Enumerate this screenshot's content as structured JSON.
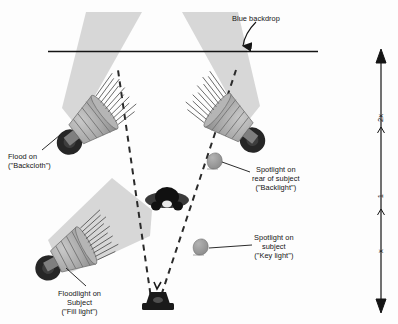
{
  "diagram": {
    "background_color": "#fdfdfd",
    "line_color": "#141414",
    "beam_color": "#d2d2d2",
    "fixture_body_color": "#a8a8a8",
    "fixture_base_color": "#2b2b2b",
    "spot_color": "#9a9a9a"
  },
  "labels": {
    "backdrop": {
      "text": "Blue backdrop",
      "x": 232,
      "y": 14
    },
    "flood_backcloth": {
      "line1": "Flood on",
      "line2": "(\"Backcloth\")",
      "x": 8,
      "y": 152
    },
    "spot_backlight": {
      "line1": "Spotlight on",
      "line2": "rear of subject",
      "line3": "(\"Backlight\")",
      "x": 252,
      "y": 165
    },
    "spot_key": {
      "line1": "Spotlight on",
      "line2": "subject",
      "line3": "(\"Key light\")",
      "x": 254,
      "y": 233
    },
    "flood_fill": {
      "line1": "Floodlight on",
      "line2": "Subject",
      "line3": "(\"Fill light\")",
      "x": 58,
      "y": 289
    }
  },
  "axis": {
    "name": "distance-scale",
    "segments": [
      {
        "label": "2x",
        "y": 118
      },
      {
        "label": "1",
        "y": 196
      },
      {
        "label": "x",
        "y": 251
      }
    ],
    "arrow_top_y": 52,
    "arrow_bottom_y": 310,
    "x": 381
  },
  "elements": {
    "backdrop_line": "backdrop-line",
    "subject": "subject-head",
    "camera": "camera",
    "flood_left": "flood-light-backcloth-left",
    "flood_right": "flood-light-backcloth-right",
    "flood_fill": "floodlight-fill",
    "spot_backlight": "spotlight-backlight",
    "spot_key": "spotlight-key-light",
    "view_lines": "camera-view-dashed-lines"
  }
}
